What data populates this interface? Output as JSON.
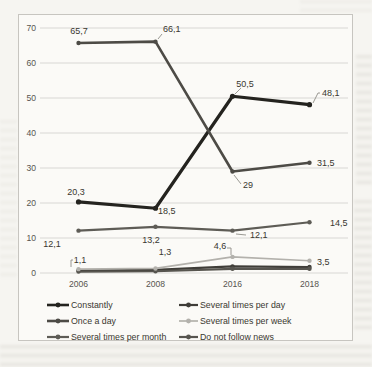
{
  "page": {
    "background_color": "#f6f5f1"
  },
  "colors": {
    "grid": "#d8d7d4",
    "axis_text": "#57554f",
    "label_text": "#39372f",
    "leader_line": "#8f8d87",
    "chart_border": "#c7c5c0",
    "chart_bg": "#fbfaf7"
  },
  "chart_data": {
    "type": "line",
    "title": "",
    "xlabel": "",
    "ylabel": "",
    "categories": [
      "2006",
      "2008",
      "2016",
      "2018"
    ],
    "series": [
      {
        "name": "Constantly",
        "values": [
          20.3,
          18.5,
          50.5,
          48.1
        ],
        "point_labels": [
          "20,3",
          "18,5",
          "50,5",
          "48,1"
        ],
        "color": "#24231f",
        "width": 3.2
      },
      {
        "name": "Once a day",
        "values": [
          65.7,
          66.1,
          29.0,
          31.5
        ],
        "point_labels": [
          "65,7",
          "66,1",
          "29",
          "31,5"
        ],
        "color": "#4d4b46",
        "width": 2.6
      },
      {
        "name": "Several times per month",
        "values": [
          12.1,
          13.2,
          12.1,
          14.5
        ],
        "point_labels": [
          "12,1",
          "13,2",
          "12,1",
          "14,5"
        ],
        "color": "#5e5c56",
        "width": 2.2
      },
      {
        "name": "Several times per day",
        "values": [
          0.7,
          0.9,
          1.9,
          1.7
        ],
        "point_labels": null,
        "color": "#3f3d38",
        "width": 2.2
      },
      {
        "name": "Several times per week",
        "values": [
          1.1,
          1.3,
          4.6,
          3.5
        ],
        "point_labels": [
          "1,1",
          "1,3",
          "4,6",
          "3,5"
        ],
        "color": "#b3b1ac",
        "width": 1.7
      },
      {
        "name": "Do not follow news",
        "values": [
          0.4,
          0.5,
          1.2,
          1.2
        ],
        "point_labels": null,
        "color": "#57554f",
        "width": 2.2
      }
    ],
    "ylim": [
      0,
      70
    ],
    "yticks": [
      70,
      60,
      50,
      40,
      30,
      20,
      10,
      0
    ],
    "grid": true,
    "legend_position": "bottom",
    "legend_columns": 2,
    "legend_order": [
      "Constantly",
      "Several times per day",
      "Once a day",
      "Several times per week",
      "Several times per month",
      "Do not follow news"
    ]
  }
}
